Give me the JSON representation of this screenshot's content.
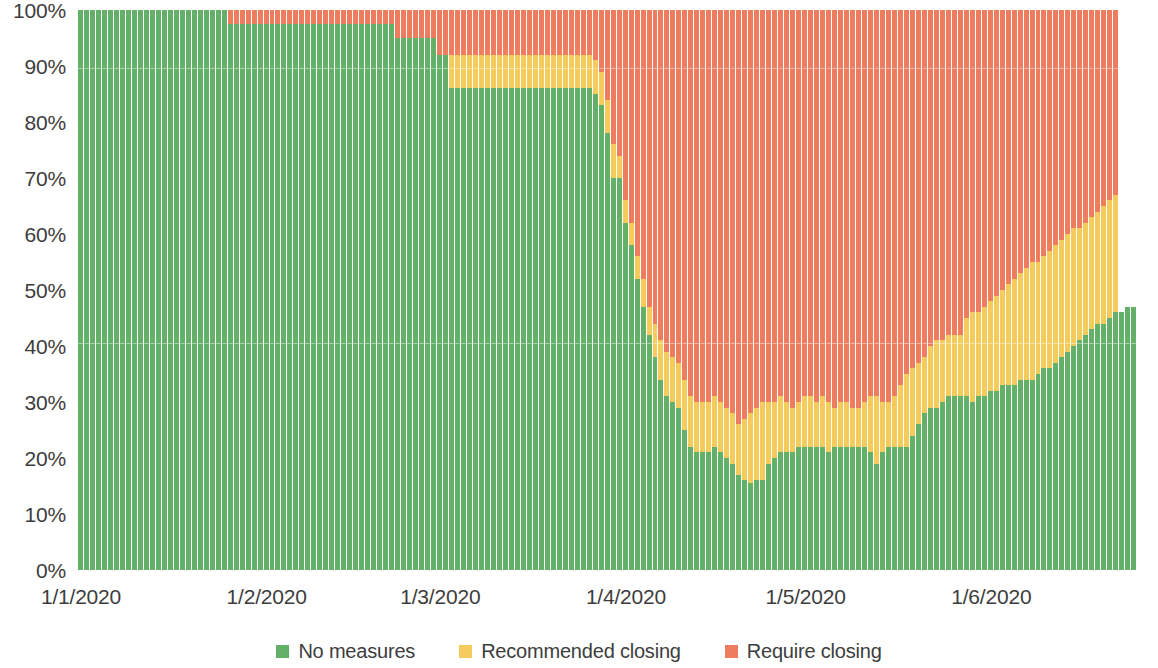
{
  "chart_data": {
    "type": "bar",
    "subtype": "stacked-percentage",
    "title": "",
    "subtitle": "",
    "xlabel": "",
    "ylabel": "",
    "ylim": [
      0,
      100
    ],
    "grid": false,
    "legend_position": "bottom",
    "y_ticks": [
      "0%",
      "10%",
      "20%",
      "30%",
      "40%",
      "50%",
      "60%",
      "70%",
      "80%",
      "90%",
      "100%"
    ],
    "y_tick_values": [
      0,
      10,
      20,
      30,
      40,
      50,
      60,
      70,
      80,
      90,
      100
    ],
    "x_ticks": [
      "1/1/2020",
      "1/2/2020",
      "1/3/2020",
      "1/4/2020",
      "1/5/2020",
      "1/6/2020"
    ],
    "x_tick_positions_days": [
      0,
      31,
      60,
      91,
      121,
      152
    ],
    "colors": {
      "no_measures": "#63b168",
      "recommended_closing": "#f5cb5c",
      "require_closing": "#ed7d5e",
      "axis_text": "#3d3d3d",
      "background": "#ffffff"
    },
    "legend": [
      {
        "label": "No measures",
        "color": "#63b168"
      },
      {
        "label": "Recommended closing",
        "color": "#f5cb5c"
      },
      {
        "label": "Require closing",
        "color": "#ed7d5e"
      }
    ],
    "series": [
      {
        "name": "No measures",
        "color": "#63b168"
      },
      {
        "name": "Recommended closing",
        "color": "#f5cb5c"
      },
      {
        "name": "Require closing",
        "color": "#ed7d5e"
      }
    ],
    "stack_order": [
      "No measures",
      "Recommended closing",
      "Require closing"
    ],
    "n_bars": 180,
    "green": [
      100,
      100,
      100,
      100,
      100,
      100,
      100,
      100,
      100,
      100,
      100,
      100,
      100,
      100,
      100,
      100,
      100,
      100,
      100,
      100,
      100,
      100,
      100,
      100,
      100,
      97.5,
      97.5,
      97.5,
      97.5,
      97.5,
      97.5,
      97.5,
      97.5,
      97.5,
      97.5,
      97.5,
      97.5,
      97.5,
      97.5,
      97.5,
      97.5,
      97.5,
      97.5,
      97.5,
      97.5,
      97.5,
      97.5,
      97.5,
      97.5,
      97.5,
      97.5,
      97.5,
      97.5,
      95,
      95,
      95,
      95,
      95,
      95,
      95,
      92,
      92,
      86,
      86,
      86,
      86,
      86,
      86,
      86,
      86,
      86,
      86,
      86,
      86,
      86,
      86,
      86,
      86,
      86,
      86,
      86,
      86,
      86,
      86,
      86,
      86,
      85,
      83,
      78,
      70,
      70,
      62,
      58,
      52,
      47,
      42,
      38,
      34,
      31,
      30,
      29,
      25,
      22,
      21,
      21,
      21,
      22,
      21,
      20,
      19,
      17,
      16,
      15.5,
      16,
      16,
      19,
      20,
      21,
      21,
      21,
      22,
      22,
      22,
      22,
      22,
      21,
      22,
      22,
      22,
      22,
      22,
      22,
      21,
      19,
      21,
      22,
      22,
      22,
      22,
      24,
      26,
      28,
      29,
      29,
      30,
      31,
      31,
      31,
      31,
      30,
      31,
      31,
      32,
      32,
      33,
      33,
      33,
      34,
      34,
      34,
      35,
      36,
      36,
      37,
      38,
      39,
      40,
      41,
      42,
      43,
      44,
      44,
      45,
      46,
      46,
      47,
      47
    ],
    "green_plus_yellow": [
      100,
      100,
      100,
      100,
      100,
      100,
      100,
      100,
      100,
      100,
      100,
      100,
      100,
      100,
      100,
      100,
      100,
      100,
      100,
      100,
      100,
      100,
      100,
      100,
      100,
      97.5,
      97.5,
      97.5,
      97.5,
      97.5,
      97.5,
      97.5,
      97.5,
      97.5,
      97.5,
      97.5,
      97.5,
      97.5,
      97.5,
      97.5,
      97.5,
      97.5,
      97.5,
      97.5,
      97.5,
      97.5,
      97.5,
      97.5,
      97.5,
      97.5,
      97.5,
      97.5,
      97.5,
      95,
      95,
      95,
      95,
      95,
      95,
      95,
      92,
      92,
      92,
      92,
      92,
      92,
      92,
      92,
      92,
      92,
      92,
      92,
      92,
      92,
      92,
      92,
      92,
      92,
      92,
      92,
      92,
      92,
      92,
      92,
      92,
      92,
      91,
      89,
      84,
      76,
      74,
      66,
      62,
      56,
      52,
      47,
      44,
      41,
      39,
      38,
      37,
      34,
      31,
      30,
      30,
      30,
      31,
      30,
      29,
      28,
      26,
      27,
      28,
      29,
      30,
      30,
      30,
      31,
      30,
      29,
      30,
      31,
      31,
      30,
      31,
      30,
      29,
      30,
      30,
      29,
      29,
      30,
      31,
      31,
      30,
      30,
      31,
      33,
      35,
      36,
      37,
      38,
      40,
      41,
      41,
      42,
      42,
      42,
      45,
      46,
      46,
      47,
      48,
      49,
      50,
      51,
      52,
      53,
      54,
      55,
      55,
      56,
      57,
      58,
      59,
      60,
      61,
      61,
      62,
      63,
      64,
      65,
      66,
      67
    ],
    "red_top": 100
  },
  "legend": {
    "items": [
      {
        "label": "No measures",
        "color": "#63b168",
        "swatch": "legend-swatch-green"
      },
      {
        "label": "Recommended closing",
        "color": "#f5cb5c",
        "swatch": "legend-swatch-yellow"
      },
      {
        "label": "Require closing",
        "color": "#ed7d5e",
        "swatch": "legend-swatch-red"
      }
    ]
  }
}
